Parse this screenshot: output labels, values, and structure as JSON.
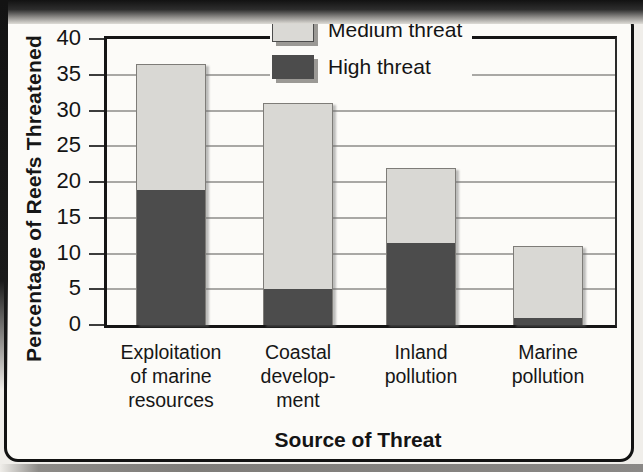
{
  "axes": {
    "y_title": "Percentage of Reefs Threatened",
    "x_title": "Source of Threat"
  },
  "legend": {
    "position": "upper right",
    "items": [
      {
        "name": "medium-threat",
        "label": "Medium threat",
        "color": "#dad9d5"
      },
      {
        "name": "high-threat",
        "label": "High threat",
        "color": "#4c4c4c"
      }
    ]
  },
  "chart_data": {
    "type": "bar",
    "stacked": true,
    "title": "",
    "xlabel": "Source of Threat",
    "ylabel": "Percentage of Reefs Threatened",
    "ylim": [
      0,
      40
    ],
    "yticks": [
      0,
      5,
      10,
      15,
      20,
      25,
      30,
      35,
      40
    ],
    "gridline_ticks": [
      5,
      10,
      15,
      20,
      25,
      30,
      35
    ],
    "grid": true,
    "legend_position": "upper right",
    "categories": [
      {
        "lines": [
          "Exploitation",
          "of marine",
          "resources"
        ]
      },
      {
        "lines": [
          "Coastal",
          "develop-",
          "ment"
        ]
      },
      {
        "lines": [
          "Inland",
          "pollution"
        ]
      },
      {
        "lines": [
          "Marine",
          "pollution"
        ]
      }
    ],
    "series": [
      {
        "name": "High threat",
        "color": "#4c4c4c",
        "values": [
          19,
          5,
          11.5,
          1
        ]
      },
      {
        "name": "Medium threat",
        "color": "#d9d8d4",
        "values": [
          17.5,
          26,
          10.5,
          10
        ]
      }
    ],
    "stack_totals": [
      36.5,
      31,
      22,
      11
    ]
  },
  "scan_colors": {
    "page_background": "#f0eeea",
    "panel_background": "#fcfbf8",
    "frame": "#121212",
    "gridline": "#a9a8a5"
  }
}
